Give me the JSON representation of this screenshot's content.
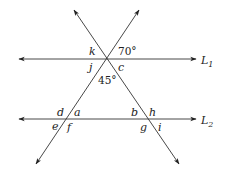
{
  "diagram": {
    "lines": [
      {
        "id": "L1",
        "label": "L",
        "subscript": "1"
      },
      {
        "id": "L2",
        "label": "L",
        "subscript": "2"
      }
    ],
    "angle_labels": {
      "k": "k",
      "j": "j",
      "c": "c",
      "d": "d",
      "a": "a",
      "e": "e",
      "f": "f",
      "b": "b",
      "h": "h",
      "g": "g",
      "i": "i"
    },
    "given_angles": {
      "top_right": "70°",
      "between_transversals": "45°"
    },
    "colors": {
      "line": "#333333",
      "text": "#222222",
      "background": "#ffffff"
    }
  }
}
